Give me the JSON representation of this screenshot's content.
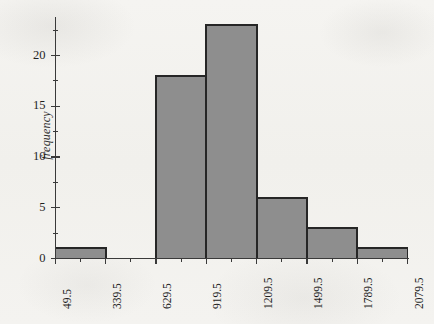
{
  "figure": {
    "kind": "histogram-figure",
    "background_color": "#f3f2ef",
    "bar_fill_color": "#8e8e8e",
    "bar_edge_color": "#262626",
    "axis_color": "#3a3a3a"
  },
  "chart_data": {
    "type": "bar",
    "title": "",
    "subtitle": "",
    "xlabel": "",
    "ylabel": "frequency",
    "categories": [
      "49.5-339.5",
      "339.5-629.5",
      "629.5-919.5",
      "919.5-1209.5",
      "1209.5-1499.5",
      "1499.5-1789.5",
      "1789.5-2079.5"
    ],
    "bin_edges": [
      49.5,
      339.5,
      629.5,
      919.5,
      1209.5,
      1499.5,
      1789.5,
      2079.5
    ],
    "values": [
      1,
      0,
      18,
      23,
      6,
      3,
      1
    ],
    "bin_width": 290,
    "xlim": [
      49.5,
      2079.5
    ],
    "ylim": [
      0,
      23.5
    ],
    "ytick_labels": [
      "0",
      "5",
      "10",
      "15",
      "20"
    ],
    "ytick_values": [
      0,
      5,
      10,
      15,
      20
    ],
    "yminor_tick_values": [
      2.5,
      7.5,
      12.5,
      17.5,
      22.5
    ],
    "xtick_labels": [
      "49.5",
      "339.5",
      "629.5",
      "919.5",
      "1209.5",
      "1499.5",
      "1789.5",
      "2079.5"
    ],
    "xtick_values": [
      49.5,
      339.5,
      629.5,
      919.5,
      1209.5,
      1499.5,
      1789.5,
      2079.5
    ],
    "xminor_tick_values": [
      194.5,
      484.5,
      774.5,
      1064.5,
      1354.5,
      1644.5,
      1934.5
    ],
    "grid": false,
    "legend": null,
    "legend_position": "none"
  }
}
